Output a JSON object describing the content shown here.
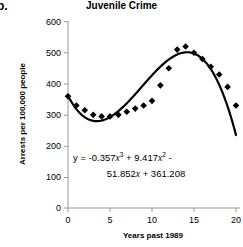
{
  "part_label": "b.",
  "chart_data": {
    "type": "scatter",
    "title": "Juvenile Crime",
    "xlabel": "Years past 1989",
    "ylabel": "Arrests per 100,000 people",
    "xlim": [
      0,
      20
    ],
    "ylim": [
      0,
      600
    ],
    "xticks": [
      0,
      5,
      10,
      15,
      20
    ],
    "yticks": [
      0,
      100,
      200,
      300,
      400,
      500,
      600
    ],
    "grid": false,
    "legend": null,
    "marker": "filled-diamond",
    "series": [
      {
        "name": "Juvenile arrests",
        "x": [
          0,
          1,
          2,
          3,
          4,
          5,
          6,
          7,
          8,
          9,
          10,
          11,
          12,
          13,
          14,
          15,
          16,
          17,
          18,
          19,
          20
        ],
        "y": [
          360,
          330,
          315,
          300,
          295,
          295,
          300,
          310,
          320,
          330,
          345,
          395,
          450,
          510,
          520,
          500,
          480,
          455,
          430,
          390,
          330
        ]
      }
    ],
    "fit_curve": {
      "label": "cubic regression",
      "equation_text": "y = -0.357x^3 + 9.417x^2 - 51.852x + 361.208",
      "coefficients": {
        "x3": -0.357,
        "x2": 9.417,
        "x1": -51.852,
        "x0": 361.208
      }
    },
    "annotation": {
      "line1_pre": "y = -0.357",
      "line1_var1": "x",
      "line1_sup1": "3",
      "line1_mid": " + 9.417",
      "line1_var2": "x",
      "line1_sup2": "2",
      "line1_post": " -",
      "line2_pre": "51.852",
      "line2_var": "x",
      "line2_post": " + 361.208"
    }
  },
  "axis": {
    "ytick_labels": [
      "600",
      "500",
      "400",
      "300",
      "200",
      "100",
      "0"
    ],
    "xtick_labels": [
      "0",
      "5",
      "10",
      "15",
      "20"
    ]
  },
  "colors": {
    "marker": "#000000",
    "curve": "#000000",
    "axis": "#808080",
    "background": "#ffffff"
  }
}
